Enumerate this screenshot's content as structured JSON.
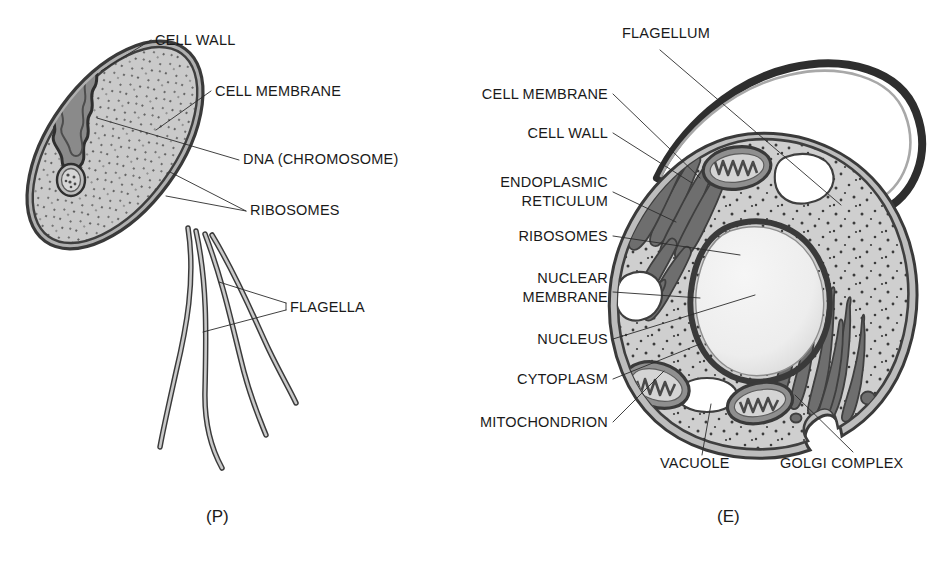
{
  "figure": {
    "background_color": "#ffffff",
    "text_color": "#1a1a1a"
  },
  "palette": {
    "cytoplasm": "#cfcfcf",
    "cytoplasm_dots": "#3c3c3c",
    "membrane_outline": "#4a4a4a",
    "wall_fill": "#b9b9b9",
    "organelle_dark": "#6e6e6e",
    "organelle_outline": "#3f3f3f",
    "nucleus_fill": "#ededed",
    "vacuole_fill": "#ffffff",
    "leader_line": "#2b2b2b",
    "flagellum_fill": "#a8a8a8"
  },
  "prokaryote": {
    "caption": "(P)",
    "labels": [
      {
        "id": "cell-wall",
        "text": "CELL WALL",
        "x": 155,
        "y": 45,
        "anchor": "start"
      },
      {
        "id": "cell-membrane",
        "text": "CELL MEMBRANE",
        "x": 215,
        "y": 96,
        "anchor": "start"
      },
      {
        "id": "dna",
        "text": "DNA (CHROMOSOME)",
        "x": 243,
        "y": 164,
        "anchor": "start"
      },
      {
        "id": "ribosomes",
        "text": "RIBOSOMES",
        "x": 250,
        "y": 215,
        "anchor": "start"
      },
      {
        "id": "flagella",
        "text": "FLAGELLA",
        "x": 290,
        "y": 312,
        "anchor": "start"
      }
    ]
  },
  "eukaryote": {
    "caption": "(E)",
    "labels": [
      {
        "id": "flagellum",
        "text": "FLAGELLUM",
        "x": 622,
        "y": 38,
        "anchor": "start"
      },
      {
        "id": "cell-membrane",
        "text": "CELL MEMBRANE",
        "x": 608,
        "y": 99,
        "anchor": "end"
      },
      {
        "id": "cell-wall",
        "text": "CELL WALL",
        "x": 608,
        "y": 138,
        "anchor": "end"
      },
      {
        "id": "endoplasmic-reticulum-1",
        "text": "ENDOPLASMIC",
        "x": 608,
        "y": 187,
        "anchor": "end"
      },
      {
        "id": "endoplasmic-reticulum-2",
        "text": "RETICULUM",
        "x": 608,
        "y": 206,
        "anchor": "end"
      },
      {
        "id": "ribosomes",
        "text": "RIBOSOMES",
        "x": 608,
        "y": 241,
        "anchor": "end"
      },
      {
        "id": "nuclear-membrane-1",
        "text": "NUCLEAR",
        "x": 608,
        "y": 283,
        "anchor": "end"
      },
      {
        "id": "nuclear-membrane-2",
        "text": "MEMBRANE",
        "x": 608,
        "y": 302,
        "anchor": "end"
      },
      {
        "id": "nucleus",
        "text": "NUCLEUS",
        "x": 608,
        "y": 344,
        "anchor": "end"
      },
      {
        "id": "cytoplasm",
        "text": "CYTOPLASM",
        "x": 608,
        "y": 384,
        "anchor": "end"
      },
      {
        "id": "mitochondrion",
        "text": "MITOCHONDRION",
        "x": 608,
        "y": 427,
        "anchor": "end"
      },
      {
        "id": "vacuole",
        "text": "VACUOLE",
        "x": 660,
        "y": 468,
        "anchor": "start"
      },
      {
        "id": "golgi-complex",
        "text": "GOLGI COMPLEX",
        "x": 780,
        "y": 468,
        "anchor": "start"
      }
    ]
  },
  "icons": {
    "prokaryote_cell": "rod-shaped-bacterium-icon",
    "eukaryote_cell": "eukaryotic-cell-icon",
    "nucleus": "nucleus-icon",
    "mitochondrion": "mitochondrion-icon",
    "golgi": "golgi-stack-icon",
    "er": "endoplasmic-reticulum-icon",
    "vacuole": "vacuole-icon",
    "flagellum": "flagellum-icon"
  }
}
